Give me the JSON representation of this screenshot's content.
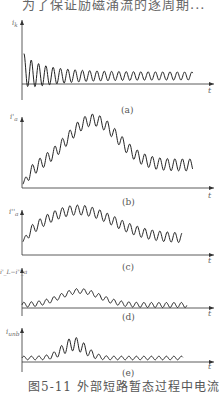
{
  "header_text": "为了保证励磁涌流的逐周期...",
  "caption": "图5-11  外部短路暂态过程中电流",
  "chart_data": [
    {
      "type": "line",
      "panel": "(a)",
      "ylabel": "i_k",
      "xlabel": "t",
      "description": "Decaying oscillating short-circuit current, high initial peak decaying to steady amplitude"
    },
    {
      "type": "line",
      "panel": "(b)",
      "ylabel": "i'_a",
      "xlabel": "t",
      "description": "Oscillation riding on a hump that rises to peak near mid then decays to steady offset"
    },
    {
      "type": "line",
      "panel": "(c)",
      "ylabel": "i''_a",
      "xlabel": "t",
      "description": "Oscillation riding on a hump, slower decay than (b)"
    },
    {
      "type": "line",
      "panel": "(d)",
      "ylabel": "i'_L - i''_a",
      "xlabel": "t",
      "description": "Small oscillation near zero with moderate hump in middle"
    },
    {
      "type": "line",
      "panel": "(e)",
      "ylabel": "i_unb",
      "xlabel": "t",
      "description": "Unbalance current: small ripple with pronounced peak in middle region"
    }
  ],
  "panels": [
    {
      "label": "(a)",
      "ylabel": "i",
      "ysub": "k",
      "xlabel": "t"
    },
    {
      "label": "(b)",
      "ylabel": "i'",
      "ysub": "a",
      "xlabel": "t"
    },
    {
      "label": "(c)",
      "ylabel": "i''",
      "ysub": "a",
      "xlabel": "t"
    },
    {
      "label": "(d)",
      "ylabel": "i'_L−i''_a",
      "ysub": "",
      "xlabel": "t"
    },
    {
      "label": "(e)",
      "ylabel": "i",
      "ysub": "unb",
      "xlabel": "t"
    }
  ]
}
